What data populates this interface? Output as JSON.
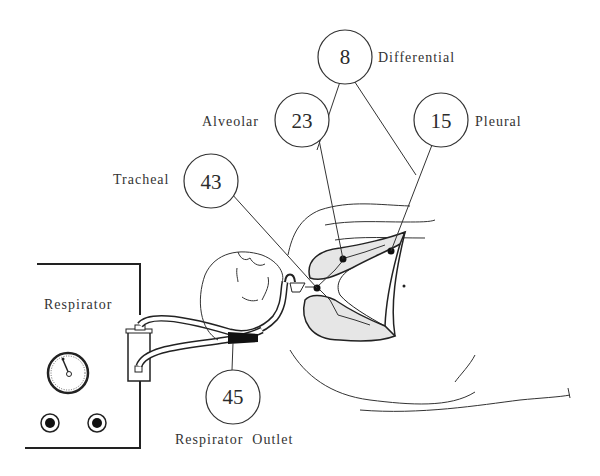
{
  "diagram": {
    "type": "pressure measurement points on ventilated patient",
    "measurements": [
      {
        "id": "differential",
        "value": "8",
        "label": "Differential"
      },
      {
        "id": "alveolar",
        "value": "23",
        "label": "Alveolar"
      },
      {
        "id": "pleural",
        "value": "15",
        "label": "Pleural"
      },
      {
        "id": "tracheal",
        "value": "43",
        "label": "Tracheal"
      },
      {
        "id": "respirator_outlet",
        "value": "45",
        "label": "Respirator  Outlet"
      }
    ],
    "device": {
      "label": "Respirator"
    },
    "colors": {
      "line": "#333333",
      "lung_fill": "#e6e6e6",
      "background": "#ffffff"
    }
  }
}
